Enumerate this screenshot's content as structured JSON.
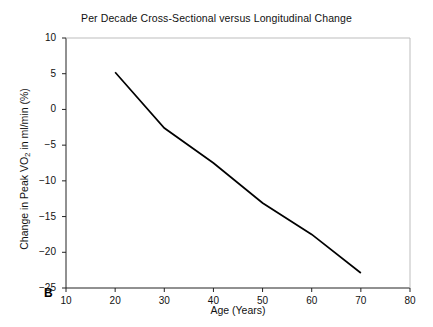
{
  "figure": {
    "panel_label": "B",
    "title": "Per Decade Cross-Sectional versus Longitudinal Change",
    "xlabel": "Age (Years)",
    "ylabel_pre": "Change in Peak VO",
    "ylabel_sub": "2",
    "ylabel_post": " in ml/min (%)"
  },
  "axes": {
    "x_ticks": [
      "10",
      "20",
      "30",
      "40",
      "50",
      "60",
      "70",
      "80"
    ],
    "y_ticks": [
      "10",
      "5",
      "0",
      "−5",
      "−10",
      "−15",
      "−20",
      "−25"
    ]
  },
  "legend": {
    "items": [
      {
        "label": "Longitudinal-Men",
        "marker": "filled-circle",
        "line": "solid",
        "color": "#000000"
      },
      {
        "label": "Longitudinal-Women",
        "marker": "open-triangle-down",
        "line": "dotted",
        "color": "#000000"
      },
      {
        "label": "Cross-Sectional Men",
        "marker": "filled-square",
        "line": "solid",
        "color": "#000000"
      },
      {
        "label": "Cross-Sectional Women",
        "marker": "open-diamond",
        "line": "dashed",
        "color": "#000000"
      }
    ]
  },
  "chart_data": {
    "type": "line",
    "title": "Per Decade Cross-Sectional versus Longitudinal Change",
    "xlabel": "Age (Years)",
    "ylabel": "Change in Peak VO2 in ml/min (%)",
    "xlim": [
      10,
      80
    ],
    "ylim": [
      -25,
      10
    ],
    "xticks": [
      10,
      20,
      30,
      40,
      50,
      60,
      70,
      80
    ],
    "yticks": [
      10,
      5,
      0,
      -5,
      -10,
      -15,
      -20,
      -25
    ],
    "grid": false,
    "legend_position": "lower-left-inside",
    "x": [
      20,
      30,
      40,
      50,
      60,
      70
    ],
    "series": [
      {
        "name": "Longitudinal-Men",
        "marker": "filled-circle",
        "line": "solid",
        "values": [
          5.2,
          -2.6,
          -7.5,
          -13.1,
          -17.5,
          -22.9
        ]
      },
      {
        "name": "Longitudinal-Women",
        "marker": "open-triangle-down",
        "line": "dotted",
        "values": [
          2.5,
          -5.3,
          -9.5,
          -13.7,
          -16.1,
          -19.2
        ]
      },
      {
        "name": "Cross-Sectional Men",
        "marker": "filled-square",
        "line": "solid",
        "values": [
          -0.1,
          -4.0,
          -8.9,
          -7.7,
          -12.3,
          -17.2
        ]
      },
      {
        "name": "Cross-Sectional Women",
        "marker": "open-diamond",
        "line": "dashed",
        "values": [
          -2.2,
          -6.9,
          -3.5,
          -10.6,
          -14.8,
          -19.0
        ]
      }
    ]
  }
}
